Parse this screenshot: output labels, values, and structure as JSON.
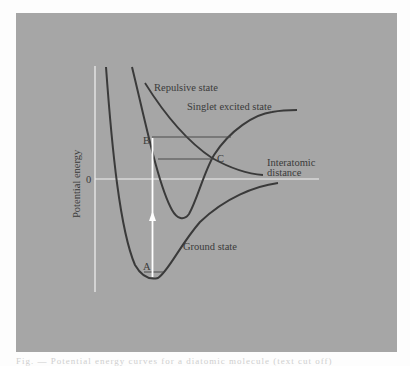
{
  "figure": {
    "y_axis_label": "Potential energy",
    "x_axis_label_line1": "Interatomic",
    "x_axis_label_line2": "distance",
    "zero_label": "0",
    "curves": {
      "ground": "Ground state",
      "singlet": "Singlet excited state",
      "repulsive": "Repulsive state"
    },
    "points": {
      "a": "A",
      "b": "B",
      "c": "C"
    },
    "colors": {
      "panel_background": "#a6a6a6",
      "curve": "#3a3a3a",
      "axis": "#f2f2f2",
      "arrow": "#ffffff"
    }
  },
  "caption": {
    "text": "Fig. — Potential energy curves for a diatomic molecule (text cut off)"
  }
}
